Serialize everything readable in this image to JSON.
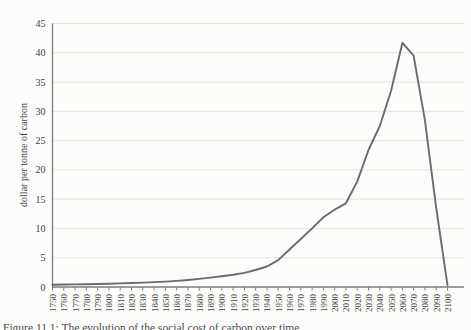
{
  "figure": {
    "caption": "Figure 11.1: The evolution of the social cost of carbon over time",
    "ylabel": "dollar per tonne of carbon"
  },
  "colors": {
    "line": "#6b6b6b",
    "grid": "#e4e4e0",
    "axis": "#7d7d7d",
    "text": "#3f3f3f",
    "background": "#fcfcfa"
  },
  "chart_data": {
    "type": "line",
    "title": "",
    "xlabel": "",
    "ylabel": "dollar per tonne of carbon",
    "ylim": [
      0,
      45
    ],
    "ytick_step": 5,
    "yticks": [
      0,
      5,
      10,
      15,
      20,
      25,
      30,
      35,
      40,
      45
    ],
    "grid": true,
    "legend": "none",
    "x": [
      1750,
      1760,
      1770,
      1780,
      1790,
      1800,
      1810,
      1820,
      1830,
      1840,
      1850,
      1860,
      1870,
      1880,
      1890,
      1900,
      1910,
      1920,
      1930,
      1940,
      1950,
      1960,
      1970,
      1980,
      1990,
      2000,
      2010,
      2020,
      2030,
      2040,
      2050,
      2060,
      2070,
      2080,
      2090,
      2100
    ],
    "series": [
      {
        "name": "dollar per tonne of carbon",
        "values": [
          0.4,
          0.42,
          0.45,
          0.48,
          0.52,
          0.57,
          0.62,
          0.68,
          0.75,
          0.83,
          0.93,
          1.05,
          1.2,
          1.38,
          1.6,
          1.85,
          2.1,
          2.4,
          2.9,
          3.5,
          4.6,
          6.4,
          8.2,
          10.0,
          11.9,
          13.2,
          14.3,
          18.0,
          23.4,
          27.5,
          33.5,
          41.7,
          39.5,
          28.5,
          13.5,
          0.3
        ]
      }
    ]
  }
}
